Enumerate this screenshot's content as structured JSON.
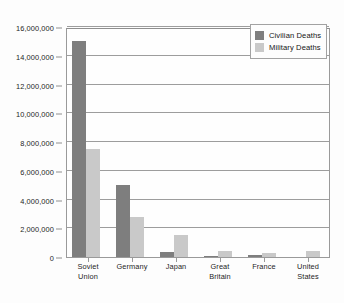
{
  "chart_data": {
    "type": "bar",
    "title": "",
    "xlabel": "",
    "ylabel": "",
    "ylim": [
      0,
      16000000
    ],
    "grid": true,
    "legend_position": "top-right",
    "categories": [
      "Soviet Union",
      "Germany",
      "Japan",
      "Great Britain",
      "France",
      "United States"
    ],
    "category_lines": [
      [
        "Soviet",
        "Union"
      ],
      [
        "Germany",
        ""
      ],
      [
        "Japan",
        ""
      ],
      [
        "Great",
        "Britain"
      ],
      [
        "France",
        ""
      ],
      [
        "United",
        "States"
      ]
    ],
    "series": [
      {
        "name": "Civilian Deaths",
        "color": "#7e7e7e",
        "values": [
          15000000,
          5000000,
          350000,
          60000,
          150000,
          0
        ]
      },
      {
        "name": "Military Deaths",
        "color": "#c9c9c9",
        "values": [
          7500000,
          2800000,
          1500000,
          450000,
          250000,
          400000
        ]
      }
    ],
    "y_ticks": [
      0,
      2000000,
      4000000,
      6000000,
      8000000,
      10000000,
      12000000,
      14000000,
      16000000
    ],
    "y_tick_labels": [
      "0",
      "2,000,000",
      "4,000,000",
      "6,000,000",
      "8,000,000",
      "10,000,000",
      "12,000,000",
      "14,000,000",
      "16,000,000"
    ]
  },
  "legend": {
    "items": [
      {
        "label": "Civilian Deaths",
        "swatch": "civilian"
      },
      {
        "label": "Military Deaths",
        "swatch": "military"
      }
    ]
  },
  "colors": {
    "civilian": "#7e7e7e",
    "military": "#c9c9c9",
    "gridline": "#9d9d9d",
    "axis": "#8f8f8f",
    "background": "#fdfdfd",
    "text": "#1d1d1d"
  }
}
